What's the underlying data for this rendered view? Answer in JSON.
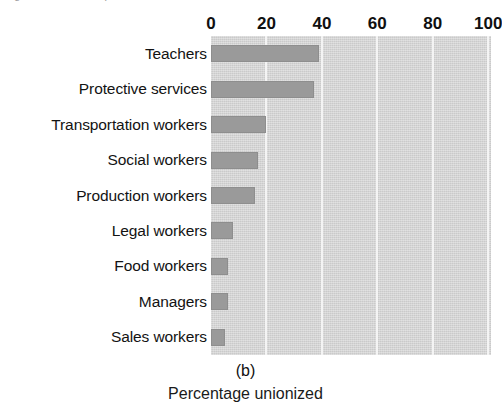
{
  "figure": {
    "panel_letter": "(b)",
    "axis_title": "Percentage unionized",
    "top_cut_text": "Figure cut off at top of scan",
    "bar_color": "#9a9a9a",
    "panel_background": "#d9d9d9",
    "gridline_color": "#f4f4f4"
  },
  "chart_data": {
    "type": "bar",
    "orientation": "horizontal",
    "title": "",
    "subtitle": "(b)",
    "xlabel": "Percentage unionized",
    "ylabel": "",
    "xlim": [
      0,
      101
    ],
    "ylim": [
      0,
      9
    ],
    "grid": true,
    "legend": "none",
    "xticks": [
      0,
      20,
      40,
      60,
      80,
      100
    ],
    "xtick_labels": [
      "0",
      "20",
      "40",
      "60",
      "80",
      "100"
    ],
    "categories": [
      "Teachers",
      "Protective services",
      "Transportation workers",
      "Social workers",
      "Production workers",
      "Legal workers",
      "Food workers",
      "Managers",
      "Sales workers"
    ],
    "values": [
      39,
      37,
      20,
      17,
      16,
      8,
      6,
      6,
      5
    ],
    "series": [
      {
        "name": "Percentage unionized",
        "values": [
          39,
          37,
          20,
          17,
          16,
          8,
          6,
          6,
          5
        ]
      }
    ]
  }
}
